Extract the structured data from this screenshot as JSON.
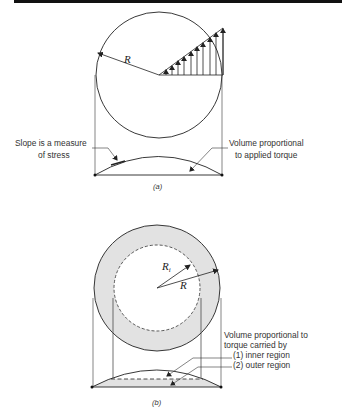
{
  "figure_a": {
    "caption": "(a)",
    "radius_label": "R",
    "annotation_left": [
      "Slope is a measure",
      "of stress"
    ],
    "annotation_right": [
      "Volume proportional",
      "to applied torque"
    ]
  },
  "figure_b": {
    "caption": "(b)",
    "inner_radius_label": "R",
    "inner_radius_subscript": "i",
    "outer_radius_label": "R",
    "annotation": [
      "Volume proportional to",
      "torque carried by",
      "(1) inner region",
      "(2) outer region"
    ]
  },
  "colors": {
    "line": "#222222",
    "shade": "#e2e2e2",
    "top_bar": "#111111"
  }
}
